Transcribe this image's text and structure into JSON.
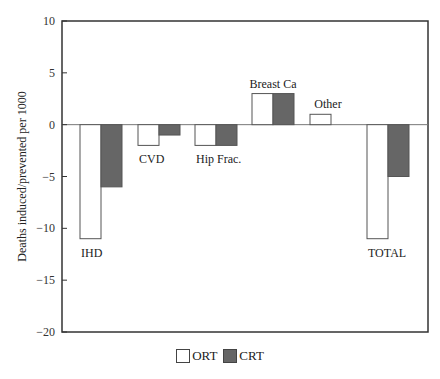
{
  "chart_data": {
    "type": "bar",
    "title": "",
    "xlabel": "",
    "ylabel": "Deaths induced/prevented per 1000",
    "ylim": [
      -20,
      10
    ],
    "yticks": [
      10,
      5,
      0,
      -5,
      -10,
      -15,
      -20
    ],
    "grid": false,
    "legend_position": "bottom",
    "categories": [
      "IHD",
      "CVD",
      "Hip Frac.",
      "Breast Ca",
      "Other",
      "TOTAL"
    ],
    "series": [
      {
        "name": "ORT",
        "color": "#ffffff",
        "values": [
          -11,
          -2,
          -2,
          3,
          1,
          -11
        ]
      },
      {
        "name": "CRT",
        "color": "#666666",
        "values": [
          -6,
          -1,
          -2,
          3,
          0,
          -5
        ]
      }
    ]
  },
  "legend": {
    "items": [
      {
        "label": "ORT",
        "color": "#ffffff"
      },
      {
        "label": "CRT",
        "color": "#666666"
      }
    ]
  }
}
